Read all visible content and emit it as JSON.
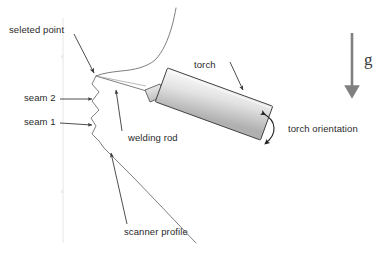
{
  "figure": {
    "width": 392,
    "height": 257,
    "background": "#ffffff"
  },
  "labels": {
    "selected_point": "seleted point",
    "seam2": "seam 2",
    "seam1": "seam 1",
    "welding_rod": "welding rod",
    "scanner_profile": "scanner profile",
    "torch": "torch",
    "torch_orientation": "torch orientation",
    "gravity": "g"
  },
  "axis_ticks": {
    "tick_upper": "0",
    "tick_lower": "0"
  },
  "colors": {
    "line": "#58595b",
    "thin_line": "#7a7b7d",
    "torch_fill_light": "#f2f2f2",
    "torch_fill_dark": "#b8b8b8",
    "torch_stroke": "#3f3f3f",
    "gravity_arrow": "#808080",
    "text": "#2a2a2a",
    "axis": "#dcdcdc"
  },
  "geometry": {
    "selected_point": [
      96,
      76
    ],
    "torch_angle_deg": 20,
    "gravity_arrow_from": [
      352,
      33
    ],
    "gravity_arrow_to": [
      352,
      98
    ]
  }
}
